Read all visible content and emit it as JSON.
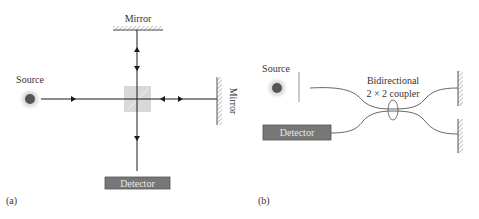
{
  "panel_a": {
    "label": "(a)",
    "source_label": "Source",
    "mirror_top_label": "Mirror",
    "mirror_right_label": "Mirror",
    "detector_label": "Detector"
  },
  "panel_b": {
    "label": "(b)",
    "source_label": "Source",
    "coupler_label_line1": "Bidirectional",
    "coupler_label_line2": "2 × 2 coupler",
    "detector_label": "Detector"
  },
  "colors": {
    "line": "#1a1a1a",
    "fiber": "#555555",
    "source_core": "#555555",
    "detector_fill": "#777777",
    "splitter": "#d8d8d8"
  }
}
